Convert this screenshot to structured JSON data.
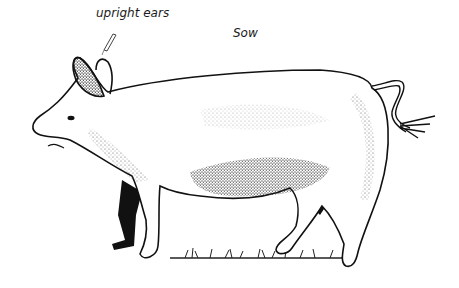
{
  "diagram": {
    "title": "Sow",
    "labels": [
      {
        "id": "ears",
        "text": "upright ears",
        "points_to": "ears"
      },
      {
        "id": "animal",
        "text": "Sow"
      }
    ],
    "colors": {
      "ink": "#111111",
      "stipple": "#333333",
      "background": "#ffffff"
    }
  }
}
